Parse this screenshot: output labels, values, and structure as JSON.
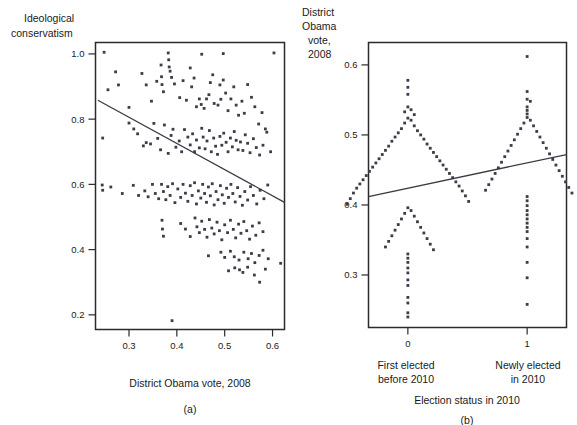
{
  "figure": {
    "width": 577,
    "height": 425,
    "background": "#ffffff",
    "point_color": "#3c3c4a",
    "line_color": "#3a3a46",
    "axis_color": "#2b2b2b"
  },
  "panel_a": {
    "id": "a",
    "caption": "(a)",
    "y_axis_title_line1": "Ideological",
    "y_axis_title_line2": "conservatism",
    "x_axis_title": "District Obama vote, 2008",
    "x_ticks": [
      "0.3",
      "0.4",
      "0.5",
      "0.6"
    ],
    "y_ticks": [
      "1.0",
      "0.8",
      "0.6",
      "0.4",
      "0.2"
    ]
  },
  "panel_b": {
    "id": "b",
    "caption": "(b)",
    "y_axis_title_line1": "District",
    "y_axis_title_line2": "Obama",
    "y_axis_title_line3": "vote,",
    "y_axis_title_line4": "2008",
    "x_axis_title": "Election status in 2010",
    "x_ticks": [
      "0",
      "1"
    ],
    "y_ticks": [
      "0.6",
      "0.5",
      "0.4",
      "0.3"
    ],
    "group0_label_line1": "First elected",
    "group0_label_line2": "before 2010",
    "group1_label_line1": "Newly elected",
    "group1_label_line2": "in 2010"
  },
  "chart_data": [
    {
      "type": "scatter",
      "panel": "a",
      "title": "",
      "xlabel": "District Obama vote, 2008",
      "ylabel": "Ideological conservatism",
      "xlim": [
        0.23,
        0.625
      ],
      "ylim": [
        0.155,
        1.035
      ],
      "xticks": [
        0.3,
        0.4,
        0.5,
        0.6
      ],
      "yticks": [
        1.0,
        0.8,
        0.6,
        0.4,
        0.2
      ],
      "grid": false,
      "legend": "none",
      "fit_line": {
        "x": [
          0.235,
          0.625
        ],
        "y": [
          0.858,
          0.545
        ]
      },
      "points": [
        [
          0.248,
          1.005
        ],
        [
          0.382,
          1.003
        ],
        [
          0.383,
          0.982
        ],
        [
          0.384,
          0.96
        ],
        [
          0.452,
          0.999
        ],
        [
          0.497,
          1.001
        ],
        [
          0.603,
          1.003
        ],
        [
          0.256,
          0.89
        ],
        [
          0.272,
          0.945
        ],
        [
          0.278,
          0.905
        ],
        [
          0.3,
          0.836
        ],
        [
          0.327,
          0.94
        ],
        [
          0.336,
          0.905
        ],
        [
          0.347,
          0.855
        ],
        [
          0.367,
          0.966
        ],
        [
          0.368,
          0.93
        ],
        [
          0.369,
          0.906
        ],
        [
          0.372,
          0.884
        ],
        [
          0.358,
          0.916
        ],
        [
          0.386,
          0.947
        ],
        [
          0.389,
          0.928
        ],
        [
          0.395,
          0.908
        ],
        [
          0.406,
          0.866
        ],
        [
          0.413,
          0.918
        ],
        [
          0.42,
          0.858
        ],
        [
          0.428,
          0.957
        ],
        [
          0.431,
          0.899
        ],
        [
          0.436,
          0.926
        ],
        [
          0.441,
          0.838
        ],
        [
          0.447,
          0.862
        ],
        [
          0.451,
          0.845
        ],
        [
          0.457,
          0.833
        ],
        [
          0.462,
          0.862
        ],
        [
          0.467,
          0.875
        ],
        [
          0.47,
          0.912
        ],
        [
          0.475,
          0.936
        ],
        [
          0.478,
          0.848
        ],
        [
          0.486,
          0.843
        ],
        [
          0.49,
          0.905
        ],
        [
          0.492,
          0.861
        ],
        [
          0.497,
          0.92
        ],
        [
          0.502,
          0.88
        ],
        [
          0.507,
          0.826
        ],
        [
          0.513,
          0.862
        ],
        [
          0.519,
          0.899
        ],
        [
          0.524,
          0.843
        ],
        [
          0.529,
          0.812
        ],
        [
          0.536,
          0.855
        ],
        [
          0.541,
          0.818
        ],
        [
          0.548,
          0.906
        ],
        [
          0.556,
          0.867
        ],
        [
          0.563,
          0.838
        ],
        [
          0.571,
          0.785
        ],
        [
          0.578,
          0.82
        ],
        [
          0.585,
          0.77
        ],
        [
          0.245,
          0.742
        ],
        [
          0.3,
          0.788
        ],
        [
          0.31,
          0.77
        ],
        [
          0.318,
          0.755
        ],
        [
          0.33,
          0.718
        ],
        [
          0.336,
          0.728
        ],
        [
          0.345,
          0.724
        ],
        [
          0.352,
          0.787
        ],
        [
          0.36,
          0.741
        ],
        [
          0.366,
          0.706
        ],
        [
          0.374,
          0.782
        ],
        [
          0.382,
          0.695
        ],
        [
          0.388,
          0.75
        ],
        [
          0.392,
          0.769
        ],
        [
          0.398,
          0.714
        ],
        [
          0.405,
          0.733
        ],
        [
          0.41,
          0.7
        ],
        [
          0.416,
          0.768
        ],
        [
          0.423,
          0.745
        ],
        [
          0.428,
          0.721
        ],
        [
          0.433,
          0.755
        ],
        [
          0.437,
          0.7
        ],
        [
          0.441,
          0.736
        ],
        [
          0.447,
          0.712
        ],
        [
          0.452,
          0.772
        ],
        [
          0.455,
          0.745
        ],
        [
          0.459,
          0.709
        ],
        [
          0.463,
          0.733
        ],
        [
          0.468,
          0.765
        ],
        [
          0.472,
          0.7
        ],
        [
          0.477,
          0.742
        ],
        [
          0.481,
          0.717
        ],
        [
          0.485,
          0.692
        ],
        [
          0.49,
          0.747
        ],
        [
          0.494,
          0.72
        ],
        [
          0.498,
          0.757
        ],
        [
          0.503,
          0.729
        ],
        [
          0.507,
          0.7
        ],
        [
          0.512,
          0.742
        ],
        [
          0.516,
          0.715
        ],
        [
          0.52,
          0.762
        ],
        [
          0.524,
          0.735
        ],
        [
          0.528,
          0.706
        ],
        [
          0.533,
          0.73
        ],
        [
          0.538,
          0.704
        ],
        [
          0.543,
          0.752
        ],
        [
          0.548,
          0.726
        ],
        [
          0.553,
          0.697
        ],
        [
          0.56,
          0.74
        ],
        [
          0.566,
          0.713
        ],
        [
          0.573,
          0.69
        ],
        [
          0.58,
          0.72
        ],
        [
          0.588,
          0.76
        ],
        [
          0.596,
          0.7
        ],
        [
          0.244,
          0.598
        ],
        [
          0.245,
          0.582
        ],
        [
          0.262,
          0.592
        ],
        [
          0.286,
          0.572
        ],
        [
          0.309,
          0.597
        ],
        [
          0.32,
          0.566
        ],
        [
          0.333,
          0.58
        ],
        [
          0.34,
          0.562
        ],
        [
          0.349,
          0.6
        ],
        [
          0.355,
          0.572
        ],
        [
          0.362,
          0.556
        ],
        [
          0.368,
          0.6
        ],
        [
          0.372,
          0.578
        ],
        [
          0.377,
          0.553
        ],
        [
          0.381,
          0.593
        ],
        [
          0.386,
          0.566
        ],
        [
          0.391,
          0.602
        ],
        [
          0.396,
          0.544
        ],
        [
          0.402,
          0.586
        ],
        [
          0.408,
          0.56
        ],
        [
          0.413,
          0.6
        ],
        [
          0.418,
          0.573
        ],
        [
          0.423,
          0.548
        ],
        [
          0.428,
          0.596
        ],
        [
          0.432,
          0.566
        ],
        [
          0.437,
          0.605
        ],
        [
          0.441,
          0.54
        ],
        [
          0.445,
          0.58
        ],
        [
          0.45,
          0.558
        ],
        [
          0.454,
          0.6
        ],
        [
          0.458,
          0.572
        ],
        [
          0.462,
          0.545
        ],
        [
          0.466,
          0.592
        ],
        [
          0.47,
          0.565
        ],
        [
          0.474,
          0.602
        ],
        [
          0.478,
          0.537
        ],
        [
          0.482,
          0.578
        ],
        [
          0.486,
          0.553
        ],
        [
          0.491,
          0.596
        ],
        [
          0.495,
          0.568
        ],
        [
          0.499,
          0.542
        ],
        [
          0.504,
          0.588
        ],
        [
          0.508,
          0.56
        ],
        [
          0.513,
          0.6
        ],
        [
          0.517,
          0.572
        ],
        [
          0.522,
          0.546
        ],
        [
          0.527,
          0.59
        ],
        [
          0.532,
          0.563
        ],
        [
          0.537,
          0.536
        ],
        [
          0.542,
          0.578
        ],
        [
          0.548,
          0.552
        ],
        [
          0.554,
          0.593
        ],
        [
          0.56,
          0.566
        ],
        [
          0.567,
          0.54
        ],
        [
          0.574,
          0.582
        ],
        [
          0.582,
          0.556
        ],
        [
          0.59,
          0.598
        ],
        [
          0.369,
          0.49
        ],
        [
          0.37,
          0.463
        ],
        [
          0.372,
          0.441
        ],
        [
          0.408,
          0.48
        ],
        [
          0.418,
          0.463
        ],
        [
          0.428,
          0.44
        ],
        [
          0.438,
          0.497
        ],
        [
          0.442,
          0.47
        ],
        [
          0.447,
          0.452
        ],
        [
          0.452,
          0.487
        ],
        [
          0.458,
          0.462
        ],
        [
          0.463,
          0.438
        ],
        [
          0.468,
          0.492
        ],
        [
          0.473,
          0.466
        ],
        [
          0.478,
          0.448
        ],
        [
          0.484,
          0.484
        ],
        [
          0.489,
          0.458
        ],
        [
          0.494,
          0.43
        ],
        [
          0.5,
          0.476
        ],
        [
          0.506,
          0.452
        ],
        [
          0.512,
          0.49
        ],
        [
          0.518,
          0.462
        ],
        [
          0.523,
          0.436
        ],
        [
          0.529,
          0.478
        ],
        [
          0.534,
          0.45
        ],
        [
          0.54,
          0.486
        ],
        [
          0.546,
          0.458
        ],
        [
          0.552,
          0.432
        ],
        [
          0.558,
          0.472
        ],
        [
          0.565,
          0.444
        ],
        [
          0.572,
          0.482
        ],
        [
          0.58,
          0.455
        ],
        [
          0.466,
          0.381
        ],
        [
          0.492,
          0.392
        ],
        [
          0.5,
          0.376
        ],
        [
          0.512,
          0.395
        ],
        [
          0.52,
          0.378
        ],
        [
          0.53,
          0.368
        ],
        [
          0.54,
          0.392
        ],
        [
          0.549,
          0.372
        ],
        [
          0.556,
          0.388
        ],
        [
          0.563,
          0.36
        ],
        [
          0.572,
          0.382
        ],
        [
          0.58,
          0.398
        ],
        [
          0.591,
          0.372
        ],
        [
          0.617,
          0.358
        ],
        [
          0.508,
          0.335
        ],
        [
          0.521,
          0.344
        ],
        [
          0.531,
          0.338
        ],
        [
          0.538,
          0.33
        ],
        [
          0.548,
          0.346
        ],
        [
          0.562,
          0.322
        ],
        [
          0.573,
          0.3
        ],
        [
          0.585,
          0.34
        ],
        [
          0.39,
          0.182
        ]
      ]
    },
    {
      "type": "scatter",
      "panel": "b",
      "title": "",
      "xlabel": "Election status in 2010",
      "ylabel": "District Obama vote, 2008",
      "xlim": [
        -0.33,
        1.33
      ],
      "ylim": [
        0.225,
        0.632
      ],
      "xticks": [
        0,
        1
      ],
      "xticklabels": [
        "0",
        "1"
      ],
      "yticks": [
        0.6,
        0.5,
        0.4,
        0.3
      ],
      "grid": false,
      "legend": "none",
      "fit_line": {
        "x": [
          -0.33,
          1.33
        ],
        "y": [
          0.412,
          0.472
        ]
      },
      "series": [
        {
          "name": "First elected before 2010",
          "x": 0,
          "values": [
            0.578,
            0.568,
            0.558,
            0.54,
            0.536,
            0.533,
            0.529,
            0.524,
            0.521,
            0.517,
            0.513,
            0.509,
            0.506,
            0.503,
            0.5,
            0.497,
            0.494,
            0.491,
            0.487,
            0.484,
            0.481,
            0.478,
            0.475,
            0.472,
            0.469,
            0.466,
            0.463,
            0.46,
            0.457,
            0.454,
            0.451,
            0.448,
            0.445,
            0.442,
            0.439,
            0.436,
            0.433,
            0.43,
            0.427,
            0.424,
            0.42,
            0.417,
            0.413,
            0.409,
            0.405,
            0.401,
            0.396,
            0.392,
            0.388,
            0.384,
            0.38,
            0.376,
            0.372,
            0.368,
            0.364,
            0.36,
            0.356,
            0.352,
            0.348,
            0.344,
            0.34,
            0.336,
            0.33,
            0.324,
            0.318,
            0.31,
            0.303,
            0.293,
            0.285,
            0.268,
            0.26,
            0.246,
            0.24
          ]
        },
        {
          "name": "Newly elected in 2010",
          "x": 1,
          "values": [
            0.612,
            0.562,
            0.551,
            0.548,
            0.54,
            0.535,
            0.53,
            0.525,
            0.521,
            0.517,
            0.513,
            0.509,
            0.505,
            0.501,
            0.497,
            0.493,
            0.489,
            0.485,
            0.481,
            0.477,
            0.473,
            0.469,
            0.465,
            0.461,
            0.457,
            0.453,
            0.449,
            0.445,
            0.441,
            0.437,
            0.433,
            0.429,
            0.425,
            0.421,
            0.417,
            0.412,
            0.406,
            0.399,
            0.392,
            0.386,
            0.38,
            0.374,
            0.368,
            0.362,
            0.352,
            0.34,
            0.318,
            0.296,
            0.258
          ]
        }
      ]
    }
  ]
}
